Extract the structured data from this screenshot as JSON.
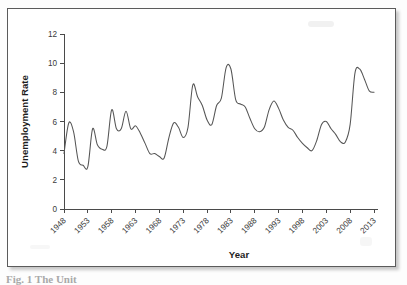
{
  "figure": {
    "frame_border_color": "#5b5b5b",
    "background_color": "#ffffff",
    "caption_fragment": "Fig. 1  The Unit"
  },
  "chart_data": {
    "type": "line",
    "title": "",
    "subtitle": "",
    "xlabel": "Year",
    "ylabel": "Unemployment Rate",
    "xlim": [
      1948,
      2013
    ],
    "ylim": [
      0,
      12
    ],
    "ytick_labels": [
      "0",
      "2",
      "4",
      "6",
      "8",
      "10",
      "12"
    ],
    "yticks": [
      0,
      2,
      4,
      6,
      8,
      10,
      12
    ],
    "xtick_labels": [
      "1948",
      "1953",
      "1958",
      "1963",
      "1968",
      "1973",
      "1978",
      "1983",
      "1988",
      "1993",
      "1998",
      "2003",
      "2008",
      "2013"
    ],
    "xticks": [
      1948,
      1953,
      1958,
      1963,
      1968,
      1973,
      1978,
      1983,
      1988,
      1993,
      1998,
      2003,
      2008,
      2013
    ],
    "grid": false,
    "legend": false,
    "legend_position": "none",
    "line_color": "#555555",
    "series": [
      {
        "name": "Unemployment Rate",
        "x": [
          1948,
          1949,
          1950,
          1951,
          1952,
          1953,
          1954,
          1955,
          1956,
          1957,
          1958,
          1959,
          1960,
          1961,
          1962,
          1963,
          1964,
          1965,
          1966,
          1967,
          1968,
          1969,
          1970,
          1971,
          1972,
          1973,
          1974,
          1975,
          1976,
          1977,
          1978,
          1979,
          1980,
          1981,
          1982,
          1983,
          1984,
          1985,
          1986,
          1987,
          1988,
          1989,
          1990,
          1991,
          1992,
          1993,
          1994,
          1995,
          1996,
          1997,
          1998,
          1999,
          2000,
          2001,
          2002,
          2003,
          2004,
          2005,
          2006,
          2007,
          2008,
          2009,
          2010,
          2011,
          2012,
          2013
        ],
        "values": [
          3.8,
          5.9,
          5.3,
          3.3,
          3.0,
          2.9,
          5.5,
          4.4,
          4.1,
          4.3,
          6.8,
          5.5,
          5.5,
          6.7,
          5.5,
          5.7,
          5.2,
          4.5,
          3.8,
          3.8,
          3.6,
          3.5,
          4.9,
          5.9,
          5.6,
          4.9,
          5.6,
          8.5,
          7.7,
          7.1,
          6.1,
          5.8,
          7.1,
          7.6,
          9.7,
          9.6,
          7.5,
          7.2,
          7.0,
          6.2,
          5.5,
          5.3,
          5.6,
          6.8,
          7.4,
          6.9,
          6.1,
          5.6,
          5.4,
          4.9,
          4.5,
          4.2,
          4.0,
          4.7,
          5.8,
          6.0,
          5.5,
          5.1,
          4.6,
          4.6,
          5.8,
          9.3,
          9.6,
          8.9,
          8.1,
          8.0
        ]
      }
    ],
    "annotations": []
  }
}
